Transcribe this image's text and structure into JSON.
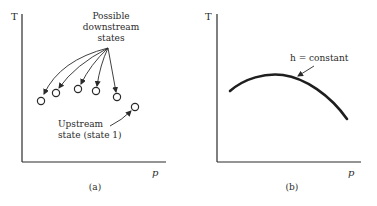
{
  "figure": {
    "panel_a": {
      "caption": "(a)",
      "y_axis_label": "T",
      "x_axis_label": "p",
      "downstream_label": [
        "Possible",
        "downstream",
        "states"
      ],
      "upstream_label": [
        "Upstream",
        "state (state 1)"
      ],
      "downstream_states": [
        {
          "x": 41,
          "y": 101
        },
        {
          "x": 56,
          "y": 93
        },
        {
          "x": 78,
          "y": 89
        },
        {
          "x": 96,
          "y": 91
        },
        {
          "x": 117,
          "y": 97
        }
      ],
      "upstream_state": {
        "x": 135,
        "y": 107
      }
    },
    "panel_b": {
      "caption": "(b)",
      "y_axis_label": "T",
      "x_axis_label": "p",
      "curve_label": "h = constant"
    },
    "colors": {
      "ink": "#2a2a2a",
      "background": "#ffffff"
    }
  }
}
